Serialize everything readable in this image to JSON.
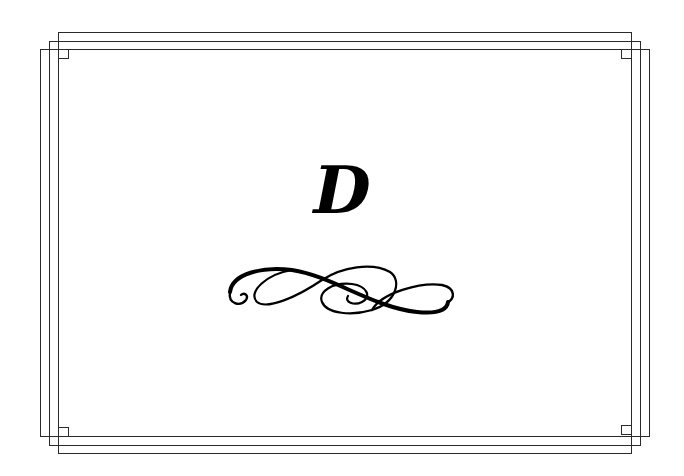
{
  "page": {
    "letter": "D",
    "ornament": "flourish-ornament",
    "frame_color": "#2a2a2a",
    "ink_color": "#000000",
    "background": "#ffffff"
  }
}
